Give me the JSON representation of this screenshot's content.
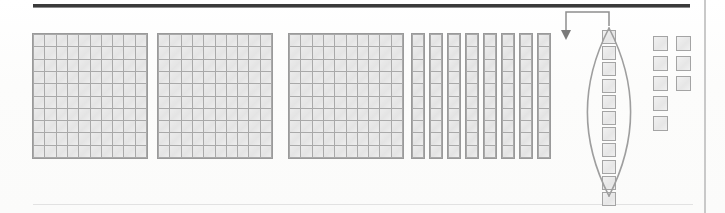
{
  "figure": {
    "title": "Base-ten blocks place-value regrouping diagram",
    "caption": "",
    "background_color": "#fdfdfc",
    "block_fill_color": "#e9e9e9",
    "block_line_color": "#a9a9a9",
    "rule_color": "#3a3a3a"
  },
  "rules": {
    "top": {
      "name": "top-rule",
      "x": 33,
      "y": 4,
      "width": 657,
      "height": 3
    },
    "right": {
      "name": "right-rule",
      "x": 704,
      "y": 0,
      "width": 2,
      "height": 213
    },
    "bottom": {
      "name": "bottom-rule",
      "x": 33,
      "y": 204,
      "width": 660,
      "height": 1
    }
  },
  "groups": [
    {
      "name": "hundreds-flat-1",
      "type": "hundred-flat",
      "label": "100",
      "rows": 10,
      "columns": 10,
      "count": 100,
      "x": 32,
      "y": 33,
      "width": 116,
      "height": 126
    },
    {
      "name": "hundreds-flat-2",
      "type": "hundred-flat",
      "label": "100",
      "rows": 10,
      "columns": 10,
      "count": 100,
      "x": 157,
      "y": 33,
      "width": 116,
      "height": 126
    },
    {
      "name": "hundreds-flat-3",
      "type": "hundred-flat",
      "label": "100",
      "rows": 10,
      "columns": 10,
      "count": 100,
      "x": 288,
      "y": 33,
      "width": 116,
      "height": 126
    }
  ],
  "ten_strips": {
    "name": "tens-rods",
    "type": "ten-rod",
    "label": "10",
    "count": 8,
    "cells_per_strip": 10,
    "start_x": 411,
    "y": 33,
    "pitch": 18,
    "width": 14,
    "height": 126
  },
  "regrouped_column": {
    "name": "regrouped-ones-column",
    "type": "ones-column",
    "label": "1",
    "count": 11,
    "x": 602,
    "start_y": 30,
    "pitch": 16.2,
    "size": 14,
    "note": "column of unit cubes enclosed by a lens outline"
  },
  "lens": {
    "name": "regroup-lens-outline",
    "cx": 609,
    "cy": 112,
    "rx": 32,
    "ry": 84
  },
  "arrow": {
    "name": "regroup-arrow",
    "direction": "down",
    "from_x": 609,
    "from_y": 26,
    "elbow_y": 12,
    "to_x": 566,
    "to_y": 40
  },
  "ones_cluster": {
    "name": "ones-cluster",
    "type": "ones-group",
    "label": "1",
    "columns": [
      {
        "name": "ones-cluster-left-column",
        "x": 653,
        "start_y": 36,
        "count": 5
      },
      {
        "name": "ones-cluster-right-column",
        "x": 676,
        "start_y": 36,
        "count": 3
      }
    ],
    "pitch": 20,
    "size": 15,
    "total": 8
  }
}
